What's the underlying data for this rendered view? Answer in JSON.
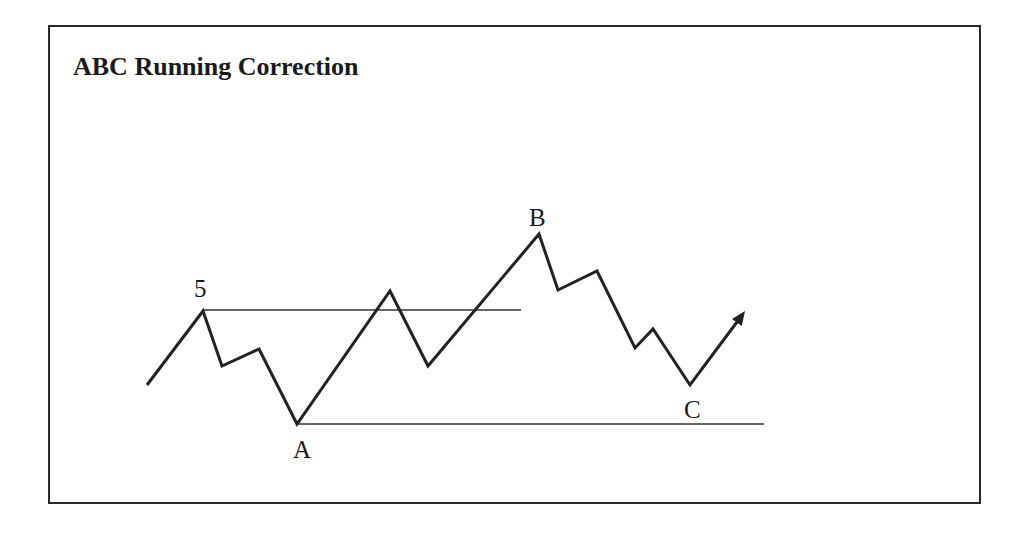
{
  "title": "ABC Running Correction",
  "colors": {
    "line": "#222222",
    "frame": "#2a2a2a",
    "background": "#ffffff"
  },
  "wave": {
    "points": [
      [
        147,
        385
      ],
      [
        203,
        311
      ],
      [
        222,
        366
      ],
      [
        259,
        349
      ],
      [
        297,
        424
      ],
      [
        390,
        291
      ],
      [
        428,
        366
      ],
      [
        539,
        234
      ],
      [
        558,
        290
      ],
      [
        597,
        271
      ],
      [
        635,
        348
      ],
      [
        653,
        329
      ],
      [
        690,
        385
      ],
      [
        740,
        318
      ]
    ],
    "arrow_tip": [
      745,
      311
    ]
  },
  "reference_lines": [
    {
      "name": "wave-5-level",
      "x1": 203,
      "x2": 521,
      "y": 310
    },
    {
      "name": "wave-a-level",
      "x1": 297,
      "x2": 764,
      "y": 424
    }
  ],
  "labels": [
    {
      "id": "five",
      "text": "5",
      "x": 194,
      "y": 297
    },
    {
      "id": "a",
      "text": "A",
      "x": 293,
      "y": 458
    },
    {
      "id": "b",
      "text": "B",
      "x": 529,
      "y": 226
    },
    {
      "id": "c",
      "text": "C",
      "x": 684,
      "y": 418
    }
  ]
}
